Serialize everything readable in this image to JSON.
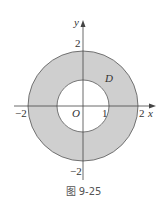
{
  "figure": {
    "caption": "图 9-25",
    "region_label": "D",
    "origin_label": "O",
    "x_axis_label": "x",
    "y_axis_label": "y",
    "x_ticks": {
      "neg2": "−2",
      "pos1": "1",
      "pos2": "2"
    },
    "y_ticks": {
      "pos2": "2",
      "neg2": "−2"
    },
    "outer_radius": 2,
    "inner_radius": 1,
    "fill_color": "#cfcfcf",
    "stroke_color": "#444444"
  }
}
